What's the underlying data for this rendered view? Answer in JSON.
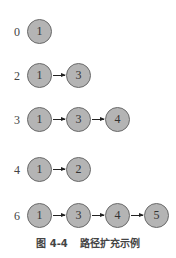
{
  "rows": [
    {
      "label": "0",
      "nodes": [
        "1"
      ]
    },
    {
      "label": "2",
      "nodes": [
        "1",
        "3"
      ]
    },
    {
      "label": "3",
      "nodes": [
        "1",
        "3",
        "4"
      ]
    },
    {
      "label": "4",
      "nodes": [
        "1",
        "2"
      ]
    },
    {
      "label": "6",
      "nodes": [
        "1",
        "3",
        "4",
        "5"
      ]
    }
  ],
  "caption": {
    "number": "图 4-4",
    "title": "路径扩充示例"
  },
  "colors": {
    "node_fill": "#b4b4b4",
    "node_border": "#6a6a6a",
    "arrow": "#222222"
  }
}
